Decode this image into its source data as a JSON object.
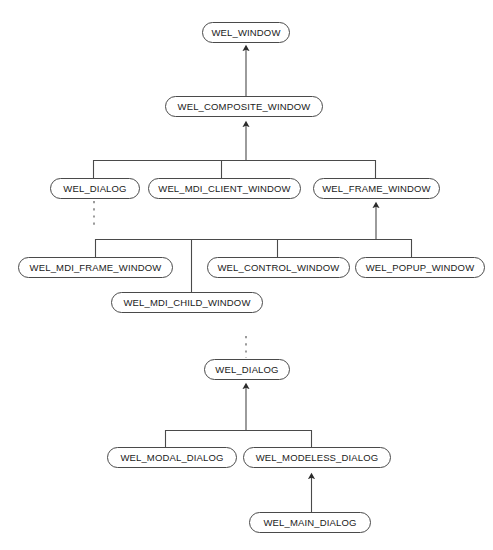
{
  "diagram": {
    "type": "class-inheritance-tree",
    "stroke_color": "#4a4a4a",
    "text_color": "#1a1a1a",
    "background_color": "#ffffff",
    "nodes": [
      {
        "id": "wel_window",
        "label": "WEL_WINDOW",
        "x": 202,
        "y": 22,
        "w": 88
      },
      {
        "id": "wel_composite_window",
        "label": "WEL_COMPOSITE_WINDOW",
        "x": 165,
        "y": 96,
        "w": 158
      },
      {
        "id": "wel_dialog_top",
        "label": "WEL_DIALOG",
        "x": 50,
        "y": 178,
        "w": 90
      },
      {
        "id": "wel_mdi_client_window",
        "label": "WEL_MDI_CLIENT_WINDOW",
        "x": 148,
        "y": 178,
        "w": 153
      },
      {
        "id": "wel_frame_window",
        "label": "WEL_FRAME_WINDOW",
        "x": 313,
        "y": 178,
        "w": 127
      },
      {
        "id": "wel_mdi_frame_window",
        "label": "WEL_MDI_FRAME_WINDOW",
        "x": 18,
        "y": 257,
        "w": 155
      },
      {
        "id": "wel_control_window",
        "label": "WEL_CONTROL_WINDOW",
        "x": 207,
        "y": 257,
        "w": 143
      },
      {
        "id": "wel_popup_window",
        "label": "WEL_POPUP_WINDOW",
        "x": 355,
        "y": 257,
        "w": 130
      },
      {
        "id": "wel_mdi_child_window",
        "label": "WEL_MDI_CHILD_WINDOW",
        "x": 111,
        "y": 292,
        "w": 152
      },
      {
        "id": "wel_dialog_bottom",
        "label": "WEL_DIALOG",
        "x": 204,
        "y": 359,
        "w": 86
      },
      {
        "id": "wel_modal_dialog",
        "label": "WEL_MODAL_DIALOG",
        "x": 107,
        "y": 447,
        "w": 130
      },
      {
        "id": "wel_modeless_dialog",
        "label": "WEL_MODELESS_DIALOG",
        "x": 243,
        "y": 447,
        "w": 148
      },
      {
        "id": "wel_main_dialog",
        "label": "WEL_MAIN_DIALOG",
        "x": 249,
        "y": 512,
        "w": 122
      }
    ],
    "edges": [
      {
        "id": "edge-composite-to-window",
        "from": "wel_composite_window",
        "to": "wel_window",
        "style": "solid",
        "arrow": "up"
      },
      {
        "id": "edge-level3-to-composite",
        "from": "level3-trunk",
        "to": "wel_composite_window",
        "style": "solid",
        "arrow": "up"
      },
      {
        "id": "edge-level4-to-frame",
        "from": "level4-trunk",
        "to": "wel_frame_window",
        "style": "solid",
        "arrow": "up"
      },
      {
        "id": "edge-dialog-continuation-down",
        "from": "wel_dialog_top",
        "to": "elided",
        "style": "dashed",
        "arrow": "none"
      },
      {
        "id": "edge-dialog-continuation-up",
        "from": "elided",
        "to": "wel_dialog_bottom",
        "style": "dashed",
        "arrow": "none"
      },
      {
        "id": "edge-dialogs-to-dialog",
        "from": "dialog-trunk",
        "to": "wel_dialog_bottom",
        "style": "solid",
        "arrow": "up"
      },
      {
        "id": "edge-main-to-modeless",
        "from": "wel_main_dialog",
        "to": "wel_modeless_dialog",
        "style": "solid",
        "arrow": "up"
      }
    ]
  }
}
